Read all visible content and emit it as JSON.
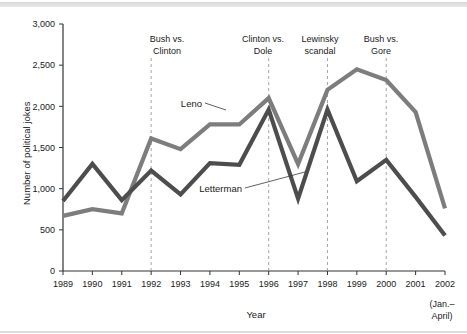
{
  "chart_data": {
    "type": "line",
    "title": "",
    "xlabel": "Year",
    "ylabel": "Number of political jokes",
    "categories": [
      "1989",
      "1990",
      "1991",
      "1992",
      "1993",
      "1994",
      "1995",
      "1996",
      "1997",
      "1998",
      "1999",
      "2000",
      "2001",
      "2002"
    ],
    "x_tick_sublabels": {
      "2002": [
        "(Jan.–",
        "April)"
      ]
    },
    "ylim": [
      0,
      3000
    ],
    "y_ticks": [
      0,
      500,
      1000,
      1500,
      2000,
      2500,
      3000
    ],
    "y_tick_labels": [
      "0",
      "500",
      "1,000",
      "1,500",
      "2,000",
      "2,500",
      "3,000"
    ],
    "grid": false,
    "legend": "inline-labels",
    "series": [
      {
        "name": "Leno",
        "color": "#7d7d7d",
        "values": [
          670,
          750,
          700,
          1610,
          1480,
          1780,
          1780,
          2100,
          1300,
          2200,
          2450,
          2320,
          1930,
          760
        ]
      },
      {
        "name": "Letterman",
        "color": "#4d4d4d",
        "values": [
          850,
          1300,
          860,
          1220,
          930,
          1310,
          1290,
          1960,
          880,
          1960,
          1090,
          1350,
          900,
          430
        ]
      }
    ],
    "annotations": [
      {
        "id": "bush-vs-clinton",
        "lines": [
          "Bush vs.",
          "Clinton"
        ],
        "year": "1992"
      },
      {
        "id": "clinton-vs-dole",
        "lines": [
          "Clinton vs.",
          "Dole"
        ],
        "year": "1996"
      },
      {
        "id": "lewinsky-scandal",
        "lines": [
          "Lewinsky",
          "scandal"
        ],
        "year": "1998"
      },
      {
        "id": "bush-vs-gore",
        "lines": [
          "Bush vs.",
          "Gore"
        ],
        "year": "2000"
      }
    ]
  },
  "axis": {
    "y_label": "Number of political jokes",
    "x_label": "Year",
    "y_ticks": [
      "3,000",
      "2,500",
      "2,000",
      "1,500",
      "1,000",
      "500",
      "0"
    ],
    "x_ticks": [
      "1989",
      "1990",
      "1991",
      "1992",
      "1993",
      "1994",
      "1995",
      "1996",
      "1997",
      "1998",
      "1999",
      "2000",
      "2001",
      "2002"
    ],
    "x_tick_extra_line1": "(Jan.–",
    "x_tick_extra_line2": "April)"
  },
  "series_labels": {
    "leno": "Leno",
    "letterman": "Letterman"
  },
  "annotations": {
    "a0_line1": "Bush vs.",
    "a0_line2": "Clinton",
    "a1_line1": "Clinton vs.",
    "a1_line2": "Dole",
    "a2_line1": "Lewinsky",
    "a2_line2": "scandal",
    "a3_line1": "Bush vs.",
    "a3_line2": "Gore"
  },
  "colors": {
    "leno": "#7d7d7d",
    "letterman": "#4d4d4d",
    "axis": "#333333",
    "annotation_line": "#9a9a9a",
    "background": "#ffffff"
  }
}
